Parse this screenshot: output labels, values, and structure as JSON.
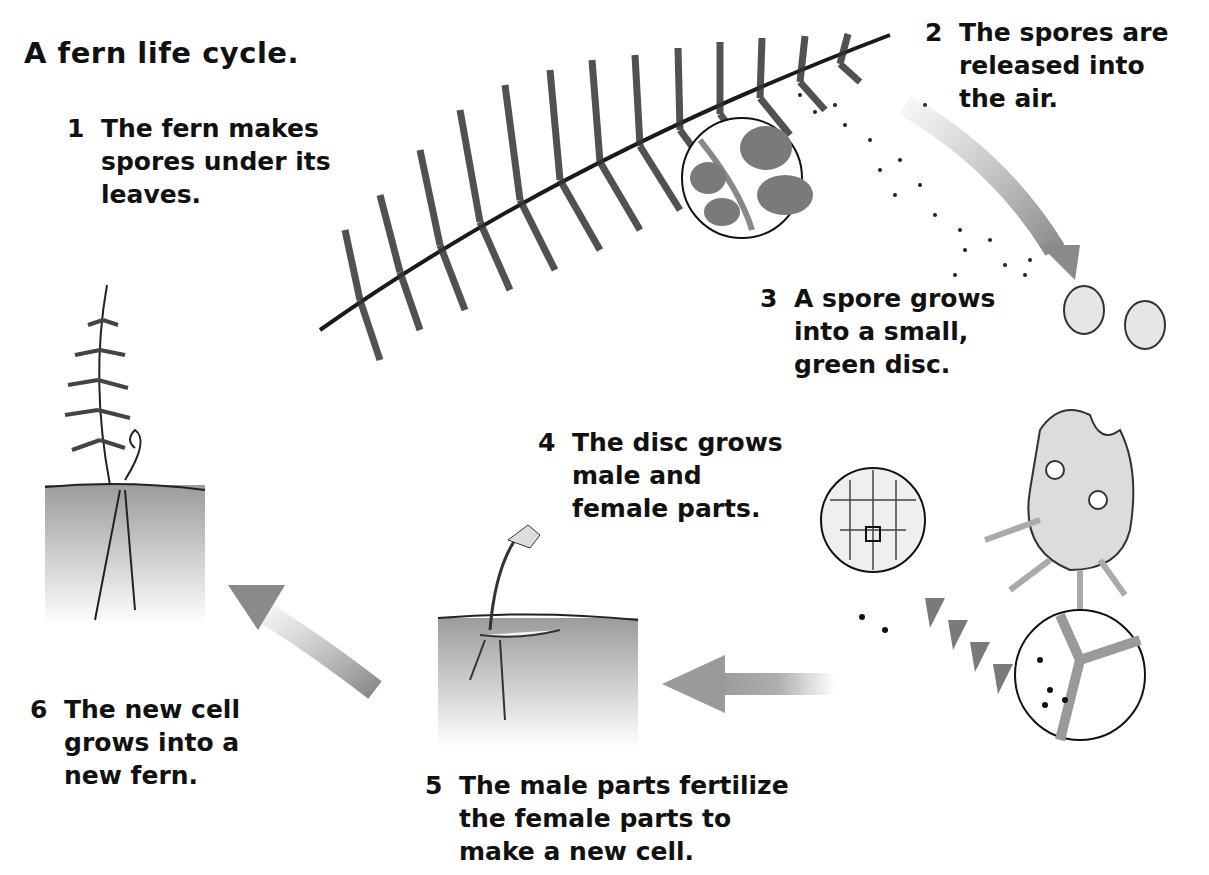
{
  "title": "A fern life cycle.",
  "steps": [
    {
      "num": "1",
      "lines": [
        "The fern makes",
        "spores under its",
        "leaves."
      ]
    },
    {
      "num": "2",
      "lines": [
        "The spores are",
        "released into",
        "the air."
      ]
    },
    {
      "num": "3",
      "lines": [
        "A spore grows",
        "into a small,",
        "green disc."
      ]
    },
    {
      "num": "4",
      "lines": [
        "The disc grows",
        "male and",
        "female parts."
      ]
    },
    {
      "num": "5",
      "lines": [
        "The male parts ",
        "fertilize",
        "the female parts to",
        "make a new ",
        "cell",
        "."
      ]
    },
    {
      "num": "6",
      "lines": [
        "The new cell",
        "grows into a",
        "new fern."
      ]
    }
  ],
  "colors": {
    "ink": "#111111",
    "arrow": "#9a9a9a",
    "leaf_inset": "#7a7a7a",
    "soil": "#b8b8b8"
  },
  "illustrations": [
    "mature-fern-frond",
    "spore-inset-magnifier",
    "released-spores",
    "small-green-discs",
    "disc-with-parts",
    "male-part-magnifier",
    "female-part-magnifier",
    "young-fern-in-soil",
    "new-fern-in-soil"
  ]
}
